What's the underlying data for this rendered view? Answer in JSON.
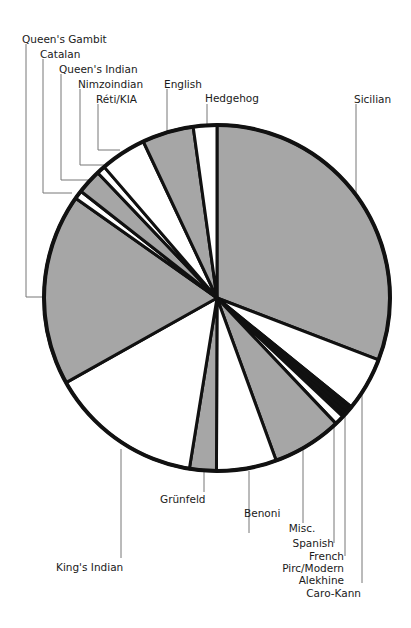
{
  "chart_data": {
    "type": "pie",
    "title": "",
    "start_angle_deg": 0,
    "direction": "clockwise",
    "unit": "percent (estimated from slice angles)",
    "slices": [
      {
        "label": "Sicilian",
        "value": 30.8,
        "color": "#a6a6a6"
      },
      {
        "label": "Caro-Kann",
        "value": 5.0,
        "color": "#ffffff"
      },
      {
        "label": "Alekhine",
        "value": 0.4,
        "color": "#111111"
      },
      {
        "label": "Pirc/Modern",
        "value": 0.4,
        "color": "#111111"
      },
      {
        "label": "French",
        "value": 0.4,
        "color": "#111111"
      },
      {
        "label": "Spanish",
        "value": 0.9,
        "color": "#ffffff"
      },
      {
        "label": "Misc.",
        "value": 6.5,
        "color": "#a6a6a6"
      },
      {
        "label": "Benoni",
        "value": 5.6,
        "color": "#ffffff"
      },
      {
        "label": "Grünfeld",
        "value": 2.5,
        "color": "#a6a6a6"
      },
      {
        "label": "King's Indian",
        "value": 14.3,
        "color": "#ffffff"
      },
      {
        "label": "Queen's Gambit",
        "value": 17.9,
        "color": "#a6a6a6"
      },
      {
        "label": "Catalan",
        "value": 0.8,
        "color": "#ffffff"
      },
      {
        "label": "Queen's Indian",
        "value": 2.3,
        "color": "#a6a6a6"
      },
      {
        "label": "Nimzoindian",
        "value": 0.8,
        "color": "#ffffff"
      },
      {
        "label": "Réti/KIA",
        "value": 4.3,
        "color": "#ffffff"
      },
      {
        "label": "English",
        "value": 4.8,
        "color": "#a6a6a6"
      },
      {
        "label": "Hedgehog",
        "value": 2.2,
        "color": "#ffffff"
      }
    ],
    "legend": "none (leader-line labels)"
  },
  "labels": {
    "queens_gambit": "Queen's Gambit",
    "catalan": "Catalan",
    "queens_indian": "Queen's Indian",
    "nimzoindian": "Nimzoindian",
    "reti": "Réti/KIA",
    "english": "English",
    "hedgehog": "Hedgehog",
    "sicilian": "Sicilian",
    "misc": "Misc.",
    "spanish": "Spanish",
    "french": "French",
    "pirc": "Pirc/Modern",
    "alekhine": "Alekhine",
    "caro_kann": "Caro-Kann",
    "benoni": "Benoni",
    "grunfeld": "Grünfeld",
    "kings_indian": "King's Indian"
  }
}
